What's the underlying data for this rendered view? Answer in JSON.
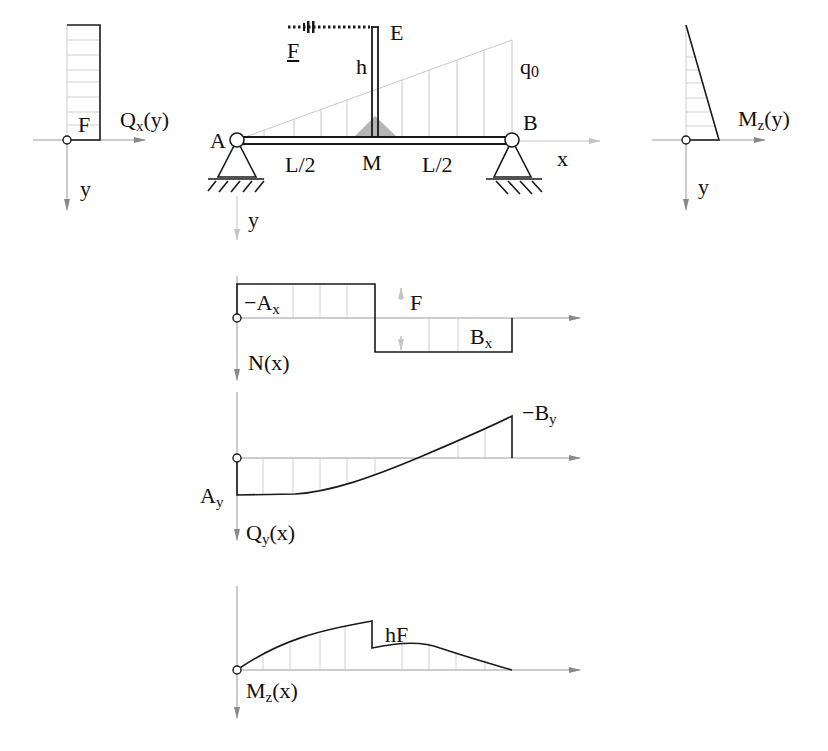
{
  "colors": {
    "line": "#1a1a1a",
    "axis": "#9a9a9a",
    "hatch": "#c8c8c8",
    "arrow": "#8a8a8a",
    "fill": "#b5b5b5"
  },
  "structure": {
    "labels": {
      "A": "A",
      "B": "B",
      "E": "E",
      "M": "M",
      "h": "h",
      "F": "F",
      "q0": "q0",
      "x": "x",
      "y": "y",
      "half_left": "L/2",
      "half_right": "L/2"
    }
  },
  "left_diagram": {
    "function": "Qx(y)",
    "func_name": "Q",
    "func_sub": "x",
    "func_arg": "(y)",
    "value_label": "F",
    "axis_label": "y"
  },
  "right_diagram": {
    "function": "Mz(y)",
    "func_name": "M",
    "func_sub": "z",
    "func_arg": "(y)",
    "axis_label": "y"
  },
  "normal_diagram": {
    "function": "N(x)",
    "func_label": "N(x)",
    "left_label_pre": "−A",
    "left_label_sub": "x",
    "right_label_pre": "B",
    "right_label_sub": "x",
    "jump_label": "F"
  },
  "shear_diagram": {
    "function": "Qy(x)",
    "func_name": "Q",
    "func_sub": "y",
    "func_arg": "(x)",
    "left_label_pre": "A",
    "left_label_sub": "y",
    "right_label_pre": "−B",
    "right_label_sub": "y"
  },
  "moment_diagram": {
    "function": "Mz(x)",
    "func_name": "M",
    "func_sub": "z",
    "func_arg": "(x)",
    "jump_label": "hF"
  },
  "chart_data": [
    {
      "type": "line",
      "title": "N(x)",
      "x": [
        0,
        0.5,
        0.5,
        1
      ],
      "values": [
        -1,
        -1,
        1,
        1
      ],
      "annotations": [
        "-Ax",
        "Bx",
        "F"
      ]
    },
    {
      "type": "line",
      "title": "Qy(x)",
      "x": [
        0,
        0.2,
        0.4,
        0.65,
        1
      ],
      "values": [
        -1,
        -0.97,
        -0.7,
        0,
        1.05
      ],
      "annotations": [
        "Ay",
        "-By"
      ]
    },
    {
      "type": "line",
      "title": "Mz(x)",
      "x": [
        0,
        0.25,
        0.5,
        0.5,
        0.7,
        1
      ],
      "values": [
        0,
        0.7,
        1,
        0.45,
        0.55,
        0
      ],
      "annotations": [
        "hF"
      ]
    }
  ]
}
